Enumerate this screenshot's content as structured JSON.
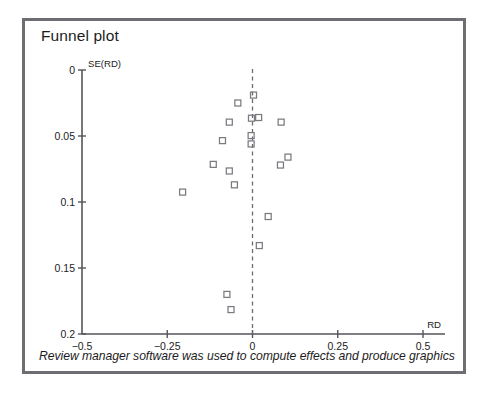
{
  "figure": {
    "title": "Funnel plot",
    "caption": "Review manager software was used to compute effects and produce graphics",
    "frame_color": "#6e6e72",
    "background": "#ffffff"
  },
  "chart_data": {
    "type": "scatter",
    "title": "Funnel plot",
    "xlabel": "RD",
    "ylabel": "SE(RD)",
    "xlim": [
      -0.5,
      0.5
    ],
    "ylim": [
      0.2,
      0.0
    ],
    "y_inverted": true,
    "grid": false,
    "legend": null,
    "x_ticks": [
      -0.5,
      -0.25,
      0,
      0.25,
      0.5
    ],
    "x_tick_labels": [
      "−0.5",
      "−0.25",
      "0",
      "0.25",
      "0.5"
    ],
    "y_ticks": [
      0,
      0.05,
      0.1,
      0.15,
      0.2
    ],
    "y_tick_labels": [
      "0",
      "0.05",
      "0.1",
      "0.15",
      "0.2"
    ],
    "reference_line": {
      "x": 0,
      "style": "dashed",
      "color": "#6a6a70",
      "label": "null effect"
    },
    "marker": {
      "shape": "open-square",
      "size": 6,
      "stroke": "#7a7a80",
      "fill": "none"
    },
    "series": [
      {
        "name": "studies",
        "points": [
          {
            "x": 0.003,
            "y": 0.019
          },
          {
            "x": -0.043,
            "y": 0.025
          },
          {
            "x": -0.003,
            "y": 0.0365
          },
          {
            "x": 0.018,
            "y": 0.036
          },
          {
            "x": -0.068,
            "y": 0.0395
          },
          {
            "x": 0.084,
            "y": 0.0395
          },
          {
            "x": -0.004,
            "y": 0.0497
          },
          {
            "x": -0.088,
            "y": 0.0535
          },
          {
            "x": -0.004,
            "y": 0.056
          },
          {
            "x": 0.104,
            "y": 0.066
          },
          {
            "x": -0.115,
            "y": 0.0715
          },
          {
            "x": 0.082,
            "y": 0.072
          },
          {
            "x": -0.068,
            "y": 0.0765
          },
          {
            "x": -0.053,
            "y": 0.087
          },
          {
            "x": -0.205,
            "y": 0.0925
          },
          {
            "x": 0.046,
            "y": 0.111
          },
          {
            "x": 0.02,
            "y": 0.133
          },
          {
            "x": -0.075,
            "y": 0.17
          },
          {
            "x": -0.063,
            "y": 0.1815
          }
        ]
      }
    ]
  }
}
